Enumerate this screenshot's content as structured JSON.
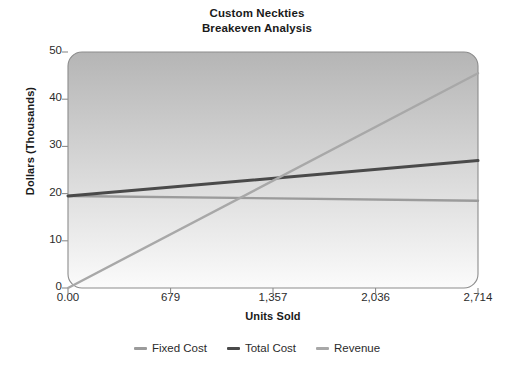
{
  "chart_data": {
    "type": "line",
    "title": "Custom Neckties Breakeven Analysis",
    "title_lines": [
      "Custom Neckties",
      "Breakeven Analysis"
    ],
    "xlabel": "Units Sold",
    "ylabel": "Dollars (Thousands)",
    "x_tick_labels": [
      "0.00",
      "679",
      "1,357",
      "2,036",
      "2,714"
    ],
    "x_tick_values": [
      0,
      679,
      1357,
      2036,
      2714
    ],
    "y_tick_labels": [
      "0",
      "10",
      "20",
      "30",
      "40",
      "50"
    ],
    "y_tick_values": [
      0,
      10,
      20,
      30,
      40,
      50
    ],
    "xlim": [
      0,
      2714
    ],
    "ylim": [
      0,
      50
    ],
    "grid": false,
    "legend_position": "bottom",
    "x": [
      0,
      2714
    ],
    "series": [
      {
        "name": "Fixed Cost",
        "color": "#9b9b9b",
        "values": [
          19.5,
          18.5
        ]
      },
      {
        "name": "Total Cost",
        "color": "#4a4a4a",
        "values": [
          19.5,
          27.0
        ]
      },
      {
        "name": "Revenue",
        "color": "#a8a8a8",
        "values": [
          0.0,
          45.5
        ]
      }
    ],
    "breakeven_point": {
      "units": 1240,
      "dollars": 21.5
    },
    "plot_background": {
      "gradient_top": "#b5b5b5",
      "gradient_bottom": "#fbfbfb",
      "border_color": "#8c8c8c"
    },
    "axis_color": "#8c8c8c",
    "text_color": "#2b2b2b"
  }
}
